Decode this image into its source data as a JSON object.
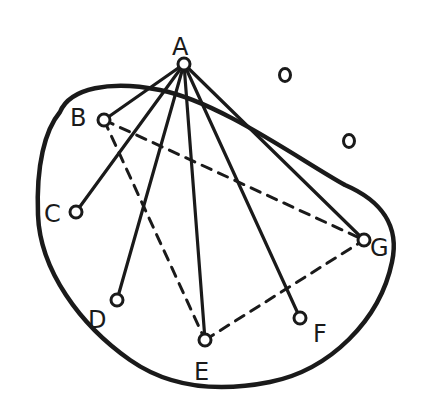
{
  "diagram": {
    "colors": {
      "ink": "#1a1a1a",
      "background": "#ffffff"
    },
    "nodes": [
      {
        "id": "A",
        "label": "A",
        "x": 184,
        "y": 64,
        "lx": 172,
        "ly": 55
      },
      {
        "id": "B",
        "label": "B",
        "x": 104,
        "y": 120,
        "lx": 70,
        "ly": 126
      },
      {
        "id": "C",
        "label": "C",
        "x": 76,
        "y": 212,
        "lx": 44,
        "ly": 222
      },
      {
        "id": "D",
        "label": "D",
        "x": 117,
        "y": 300,
        "lx": 88,
        "ly": 328
      },
      {
        "id": "E",
        "label": "E",
        "x": 205,
        "y": 340,
        "lx": 194,
        "ly": 380
      },
      {
        "id": "F",
        "label": "F",
        "x": 300,
        "y": 318,
        "lx": 313,
        "ly": 342
      },
      {
        "id": "G",
        "label": "G",
        "x": 364,
        "y": 240,
        "lx": 370,
        "ly": 256
      }
    ],
    "isolated_points": [
      {
        "x": 285,
        "y": 75
      },
      {
        "x": 349,
        "y": 141
      }
    ],
    "solid_edges": [
      [
        "A",
        "B"
      ],
      [
        "A",
        "C"
      ],
      [
        "A",
        "D"
      ],
      [
        "A",
        "E"
      ],
      [
        "A",
        "F"
      ],
      [
        "A",
        "G"
      ]
    ],
    "dashed_edges": [
      [
        "B",
        "E"
      ],
      [
        "B",
        "G"
      ],
      [
        "E",
        "G"
      ]
    ],
    "region_outline": "M 60 112 C 70 88, 110 80, 160 90 C 220 102, 300 160, 345 185 C 380 200, 400 225, 392 262 C 380 320, 330 370, 270 382 C 220 392, 170 388, 130 360 C 80 325, 40 270, 38 215 C 36 165, 45 130, 60 112 Z"
  }
}
